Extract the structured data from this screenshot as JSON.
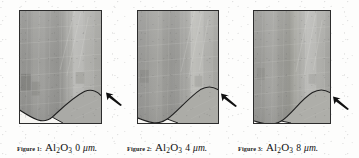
{
  "figure": {
    "kind": "micrograph-panel-series",
    "material": "Al2O3",
    "unit": "μm",
    "panel_count": 3,
    "annotation_icon": "arrow-icon",
    "colors": {
      "page_background": "#fdfdfc",
      "panel_border": "#2c2c2c",
      "matrix_gray": "#9a9a97",
      "band_light_gray": "#b9b9b5",
      "band_dark_gray": "#7e7e7b",
      "void_white": "#f6f5f2",
      "interface_line": "#1e1e1e",
      "arrow_fill": "#101010",
      "caption_text": "#161616"
    },
    "panels": [
      {
        "id": "panel-1",
        "index": 1,
        "caption_label": "Figure 1:",
        "caption_material": "Al",
        "caption_sub_1": "2",
        "caption_material_2": "O",
        "caption_sub_2": "3",
        "caption_value": "0",
        "caption_unit": "μm.",
        "caption_full": "Figure 1: Al2O3 0 μm.",
        "coating_thickness": 0,
        "arrow_target": "interface-crest"
      },
      {
        "id": "panel-2",
        "index": 2,
        "caption_label": "Figure 2:",
        "caption_material": "Al",
        "caption_sub_1": "2",
        "caption_material_2": "O",
        "caption_sub_2": "3",
        "caption_value": "4",
        "caption_unit": "μm.",
        "caption_full": "Figure 2: Al2O3 4 μm.",
        "coating_thickness": 4,
        "arrow_target": "interface-crest"
      },
      {
        "id": "panel-3",
        "index": 3,
        "caption_label": "Figure 3:",
        "caption_material": "Al",
        "caption_sub_1": "2",
        "caption_material_2": "O",
        "caption_sub_2": "3",
        "caption_value": "8",
        "caption_unit": "μm.",
        "caption_full": "Figure 3: Al2O3 8 μm.",
        "coating_thickness": 8,
        "arrow_target": "interface-crest"
      }
    ]
  }
}
